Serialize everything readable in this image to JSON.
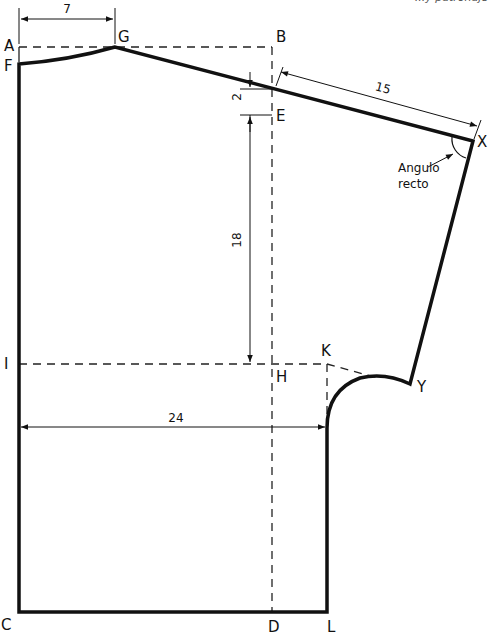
{
  "header": {
    "clipped_caption": "...y patronaje"
  },
  "points": {
    "A": "A",
    "B": "B",
    "C": "C",
    "D": "D",
    "E": "E",
    "F": "F",
    "G": "G",
    "H": "H",
    "I": "I",
    "K": "K",
    "L": "L",
    "X": "X",
    "Y": "Y"
  },
  "dimensions": {
    "neck_width": "7",
    "shoulder_drop": "2",
    "shoulder_length": "15",
    "armhole_depth": "18",
    "half_width": "24"
  },
  "annotations": {
    "right_angle_line1": "Angulo",
    "right_angle_line2": "recto"
  },
  "colors": {
    "line": "#111111",
    "background": "#ffffff"
  }
}
